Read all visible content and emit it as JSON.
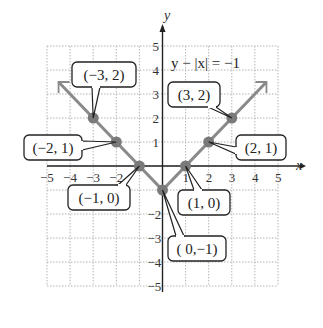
{
  "chart_data": {
    "type": "line",
    "title": "",
    "equation": "y − |x| = −1",
    "xlabel": "x",
    "ylabel": "y",
    "xlim": [
      -5,
      5
    ],
    "ylim": [
      -5,
      5
    ],
    "grid": true,
    "x_ticks": [
      "−5",
      "−4",
      "−3",
      "−2",
      "1",
      "2",
      "3",
      "4",
      "5"
    ],
    "y_ticks": [
      "5",
      "4",
      "3",
      "2",
      "1",
      "−2",
      "−3",
      "−4",
      "−5"
    ],
    "series": [
      {
        "name": "y = |x| − 1",
        "x": [
          -4,
          -3,
          -2,
          -1,
          0,
          1,
          2,
          3,
          4
        ],
        "y": [
          3,
          2,
          1,
          0,
          -1,
          0,
          1,
          2,
          3
        ]
      }
    ],
    "points": [
      {
        "x": -3,
        "y": 2,
        "label": "(−3, 2)"
      },
      {
        "x": -2,
        "y": 1,
        "label": "(−2, 1)"
      },
      {
        "x": -1,
        "y": 0,
        "label": "(−1, 0)"
      },
      {
        "x": 0,
        "y": -1,
        "label": "( 0,−1)"
      },
      {
        "x": 1,
        "y": 0,
        "label": "(1, 0)"
      },
      {
        "x": 2,
        "y": 1,
        "label": "(2, 1)"
      },
      {
        "x": 3,
        "y": 2,
        "label": "(3, 2)"
      }
    ],
    "colors": {
      "line": "#8a8a8a",
      "point": "#7a7a7a",
      "axis": "#222222",
      "grid": "#b5b5b5"
    }
  }
}
